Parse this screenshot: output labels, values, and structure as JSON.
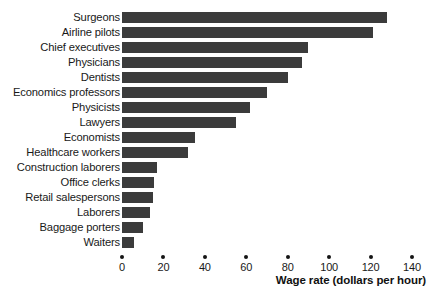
{
  "chart_data": {
    "type": "bar",
    "orientation": "horizontal",
    "title": "",
    "xlabel": "Wage rate (dollars per hour)",
    "ylabel": "",
    "xlim": [
      0,
      140
    ],
    "xticks": [
      0,
      20,
      40,
      60,
      80,
      100,
      120,
      140
    ],
    "grid": false,
    "legend": false,
    "bar_color": "#3b3b3b",
    "categories": [
      "Surgeons",
      "Airline pilots",
      "Chief executives",
      "Physicians",
      "Dentists",
      "Economics professors",
      "Physicists",
      "Lawyers",
      "Economists",
      "Healthcare workers",
      "Construction laborers",
      "Office clerks",
      "Retail salespersons",
      "Laborers",
      "Baggage porters",
      "Waiters"
    ],
    "values": [
      128,
      121,
      90,
      87,
      80,
      70,
      62,
      55,
      35,
      32,
      17,
      15.5,
      15,
      13.5,
      10,
      6
    ]
  },
  "axis": {
    "title": "Wage rate (dollars per hour)",
    "tick_labels": [
      "0",
      "20",
      "40",
      "60",
      "80",
      "100",
      "120",
      "140"
    ]
  }
}
